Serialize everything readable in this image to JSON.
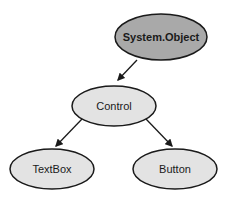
{
  "diagram": {
    "type": "class-hierarchy",
    "nodes": [
      {
        "id": "system-object",
        "label": "System.Object",
        "fill": "#a9a9a9",
        "bold": true
      },
      {
        "id": "control",
        "label": "Control",
        "fill": "#e3e3e3",
        "bold": false
      },
      {
        "id": "textbox",
        "label": "TextBox",
        "fill": "#e3e3e3",
        "bold": false
      },
      {
        "id": "button",
        "label": "Button",
        "fill": "#e3e3e3",
        "bold": false
      }
    ],
    "edges": [
      {
        "from": "system-object",
        "to": "control"
      },
      {
        "from": "control",
        "to": "textbox"
      },
      {
        "from": "control",
        "to": "button"
      }
    ],
    "colors": {
      "stroke": "#1a1a1a",
      "root_fill": "#a9a9a9",
      "child_fill": "#e3e3e3",
      "background": "#ffffff"
    }
  }
}
